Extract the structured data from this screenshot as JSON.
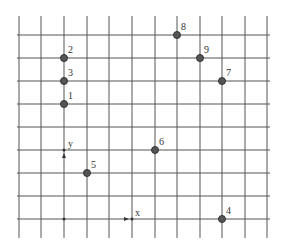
{
  "grid": {
    "x_lines": [
      19,
      41,
      64,
      87,
      109,
      132,
      155,
      177,
      200,
      222,
      245,
      267
    ],
    "y_lines": [
      35,
      58,
      81,
      104,
      127,
      150,
      173,
      196,
      219
    ],
    "top": 16,
    "bottom": 238,
    "left": 17,
    "right": 270,
    "line_color": "#555555"
  },
  "axes": {
    "origin": {
      "x": 64,
      "y": 219
    },
    "x_label": "x",
    "y_label": "y",
    "x_arrow": {
      "x": 132,
      "y": 219
    },
    "y_arrow": {
      "x": 64,
      "y": 150
    }
  },
  "points": [
    {
      "label": "1",
      "x": 64,
      "y": 104
    },
    {
      "label": "2",
      "x": 64,
      "y": 58
    },
    {
      "label": "3",
      "x": 64,
      "y": 81
    },
    {
      "label": "4",
      "x": 222,
      "y": 219
    },
    {
      "label": "5",
      "x": 87,
      "y": 173
    },
    {
      "label": "6",
      "x": 155,
      "y": 150
    },
    {
      "label": "7",
      "x": 222,
      "y": 81
    },
    {
      "label": "8",
      "x": 177,
      "y": 35
    },
    {
      "label": "9",
      "x": 200,
      "y": 58
    }
  ],
  "point_style": {
    "fill": "#555555",
    "stroke": "#333333",
    "radius": 3.5
  }
}
